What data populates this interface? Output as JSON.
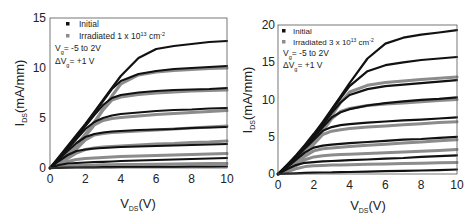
{
  "chart_data": [
    {
      "type": "line",
      "title": "",
      "xlabel": "V_DS(V)",
      "ylabel": "I_DS(mA/mm)",
      "xlim": [
        0,
        10
      ],
      "ylim": [
        0,
        15
      ],
      "xticks": [
        0,
        2,
        4,
        6,
        8,
        10
      ],
      "yticks": [
        0,
        5,
        10,
        15
      ],
      "grid": false,
      "legend_position": "upper-left",
      "legend": [
        {
          "label": "Initial",
          "marker": "square",
          "color": "#111111"
        },
        {
          "label": "Irradiated 1 x 10^13 cm^-2",
          "marker": "square",
          "color": "#8c8c8c"
        }
      ],
      "annotations": [
        "V_g = -5 to 2V",
        "ΔV_g = +1 V"
      ],
      "x": [
        0,
        0.5,
        1,
        1.5,
        2,
        2.5,
        3,
        3.5,
        4,
        5,
        6,
        7,
        8,
        9,
        10
      ],
      "series": [
        {
          "name": "Initial Vg=2V",
          "group": "Initial",
          "values": [
            0,
            1.1,
            2.2,
            3.3,
            4.4,
            5.6,
            6.8,
            8.0,
            9.2,
            11.0,
            11.9,
            12.2,
            12.4,
            12.6,
            12.7
          ]
        },
        {
          "name": "Initial Vg=1V",
          "group": "Initial",
          "values": [
            0,
            1.0,
            2.1,
            3.2,
            4.3,
            5.5,
            6.7,
            7.9,
            8.7,
            9.4,
            9.7,
            9.9,
            10.0,
            10.1,
            10.2
          ]
        },
        {
          "name": "Initial Vg=0V",
          "group": "Initial",
          "values": [
            0,
            0.95,
            2.0,
            3.1,
            4.2,
            5.3,
            6.3,
            7.0,
            7.3,
            7.55,
            7.7,
            7.8,
            7.85,
            7.9,
            8.0
          ]
        },
        {
          "name": "Initial Vg=-1V",
          "group": "Initial",
          "values": [
            0,
            0.9,
            1.9,
            2.9,
            3.9,
            4.6,
            5.0,
            5.25,
            5.4,
            5.55,
            5.7,
            5.8,
            5.85,
            5.95,
            6.0
          ]
        },
        {
          "name": "Initial Vg=-2V",
          "group": "Initial",
          "values": [
            0,
            0.85,
            1.7,
            2.5,
            3.1,
            3.4,
            3.55,
            3.65,
            3.7,
            3.8,
            3.85,
            3.9,
            4.0,
            4.05,
            4.1
          ]
        },
        {
          "name": "Initial Vg=-3V",
          "group": "Initial",
          "values": [
            0,
            0.7,
            1.3,
            1.7,
            1.85,
            1.95,
            2.0,
            2.05,
            2.1,
            2.15,
            2.2,
            2.25,
            2.3,
            2.35,
            2.4
          ]
        },
        {
          "name": "Initial Vg=-4V",
          "group": "Initial",
          "values": [
            0,
            0.3,
            0.45,
            0.5,
            0.55,
            0.6,
            0.62,
            0.65,
            0.7,
            0.75,
            0.8,
            0.85,
            0.9,
            0.95,
            1.0
          ]
        },
        {
          "name": "Initial Vg=-5V",
          "group": "Initial",
          "values": [
            0,
            0.02,
            0.04,
            0.05,
            0.06,
            0.07,
            0.08,
            0.09,
            0.1,
            0.1,
            0.11,
            0.12,
            0.13,
            0.14,
            0.15
          ]
        },
        {
          "name": "Irradiated Vg=1V",
          "group": "Irradiated",
          "values": [
            0,
            0.5,
            1.3,
            2.3,
            3.4,
            4.6,
            5.9,
            7.2,
            8.4,
            9.3,
            9.6,
            9.75,
            9.85,
            9.95,
            10.0
          ]
        },
        {
          "name": "Irradiated Vg=0V",
          "group": "Irradiated",
          "values": [
            0,
            0.5,
            1.25,
            2.2,
            3.3,
            4.5,
            5.8,
            6.8,
            7.1,
            7.35,
            7.5,
            7.6,
            7.7,
            7.75,
            7.8
          ]
        },
        {
          "name": "Irradiated Vg=-1V",
          "group": "Irradiated",
          "values": [
            0,
            0.45,
            1.2,
            2.1,
            3.2,
            4.3,
            4.75,
            4.95,
            5.05,
            5.2,
            5.35,
            5.45,
            5.55,
            5.65,
            5.75
          ]
        },
        {
          "name": "Irradiated Vg=-2V",
          "group": "Irradiated",
          "values": [
            0,
            0.45,
            1.1,
            1.9,
            2.8,
            3.3,
            3.45,
            3.55,
            3.6,
            3.7,
            3.8,
            3.9,
            4.0,
            4.1,
            4.2
          ]
        },
        {
          "name": "Irradiated Vg=-3V",
          "group": "Irradiated",
          "values": [
            0,
            0.4,
            0.95,
            1.5,
            1.85,
            2.0,
            2.1,
            2.15,
            2.2,
            2.3,
            2.4,
            2.45,
            2.55,
            2.6,
            2.7
          ]
        },
        {
          "name": "Irradiated Vg=-4V",
          "group": "Irradiated",
          "values": [
            0,
            0.3,
            0.65,
            0.85,
            0.95,
            1.0,
            1.05,
            1.1,
            1.15,
            1.2,
            1.25,
            1.3,
            1.35,
            1.4,
            1.45
          ]
        },
        {
          "name": "Irradiated Vg=-5V",
          "group": "Irradiated",
          "values": [
            0,
            0.1,
            0.2,
            0.25,
            0.28,
            0.3,
            0.32,
            0.33,
            0.34,
            0.36,
            0.38,
            0.4,
            0.42,
            0.44,
            0.45
          ]
        }
      ]
    },
    {
      "type": "line",
      "title": "",
      "xlabel": "V_DS(V)",
      "ylabel": "I_DS(mA/mm)",
      "xlim": [
        0,
        10
      ],
      "ylim": [
        0,
        20
      ],
      "xticks": [
        0,
        2,
        4,
        6,
        8,
        10
      ],
      "yticks": [
        0,
        5,
        10,
        15,
        20
      ],
      "grid": false,
      "legend_position": "upper-left",
      "legend": [
        {
          "label": "Initial",
          "marker": "square",
          "color": "#111111"
        },
        {
          "label": "Irradiated 3 x 10^13 cm^-2",
          "marker": "square",
          "color": "#8c8c8c"
        }
      ],
      "annotations": [
        "V_g = -5 to 2V",
        "ΔV_g = +1 V"
      ],
      "x": [
        0,
        0.5,
        1,
        1.5,
        2,
        2.5,
        3,
        3.5,
        4,
        5,
        6,
        7,
        8,
        9,
        10
      ],
      "series": [
        {
          "name": "Initial Vg=2V",
          "group": "Initial",
          "values": [
            0,
            1.2,
            2.5,
            3.9,
            5.4,
            7.0,
            8.7,
            10.4,
            12.2,
            15.5,
            17.5,
            18.3,
            18.7,
            19.0,
            19.3
          ]
        },
        {
          "name": "Initial Vg=1V",
          "group": "Initial",
          "values": [
            0,
            1.15,
            2.4,
            3.8,
            5.2,
            6.8,
            8.5,
            10.2,
            11.8,
            13.8,
            14.6,
            15.0,
            15.3,
            15.5,
            15.7
          ]
        },
        {
          "name": "Initial Vg=0V",
          "group": "Initial",
          "values": [
            0,
            1.1,
            2.35,
            3.7,
            5.1,
            6.6,
            8.2,
            9.6,
            10.6,
            11.4,
            11.8,
            12.0,
            12.2,
            12.4,
            12.6
          ]
        },
        {
          "name": "Initial Vg=-1V",
          "group": "Initial",
          "values": [
            0,
            1.05,
            2.25,
            3.6,
            4.9,
            6.3,
            7.6,
            8.3,
            8.7,
            9.2,
            9.5,
            9.75,
            9.95,
            10.1,
            10.3
          ]
        },
        {
          "name": "Initial Vg=-2V",
          "group": "Initial",
          "values": [
            0,
            1.0,
            2.15,
            3.4,
            4.6,
            5.8,
            6.3,
            6.55,
            6.7,
            6.9,
            7.05,
            7.2,
            7.3,
            7.45,
            7.6
          ]
        },
        {
          "name": "Initial Vg=-3V",
          "group": "Initial",
          "values": [
            0,
            0.9,
            1.9,
            2.9,
            3.55,
            3.8,
            3.95,
            4.05,
            4.15,
            4.3,
            4.45,
            4.6,
            4.7,
            4.85,
            5.0
          ]
        },
        {
          "name": "Initial Vg=-4V",
          "group": "Initial",
          "values": [
            0,
            0.65,
            1.2,
            1.5,
            1.6,
            1.7,
            1.75,
            1.8,
            1.85,
            1.95,
            2.05,
            2.15,
            2.3,
            2.4,
            2.5
          ]
        },
        {
          "name": "Initial Vg=-5V",
          "group": "Initial",
          "values": [
            0,
            0.05,
            0.1,
            0.15,
            0.18,
            0.2,
            0.22,
            0.25,
            0.27,
            0.32,
            0.37,
            0.42,
            0.47,
            0.52,
            0.6
          ]
        },
        {
          "name": "Irradiated Vg=0V",
          "group": "Irradiated",
          "values": [
            0,
            0.6,
            1.5,
            2.8,
            4.3,
            6.0,
            7.8,
            9.6,
            11.0,
            11.9,
            12.3,
            12.5,
            12.7,
            12.85,
            13.0
          ]
        },
        {
          "name": "Irradiated Vg=-1V",
          "group": "Irradiated",
          "values": [
            0,
            0.55,
            1.45,
            2.7,
            4.2,
            5.8,
            7.4,
            8.4,
            8.8,
            9.2,
            9.4,
            9.55,
            9.7,
            9.85,
            10.0
          ]
        },
        {
          "name": "Irradiated Vg=-2V",
          "group": "Irradiated",
          "values": [
            0,
            0.5,
            1.4,
            2.6,
            4.0,
            5.3,
            5.75,
            5.95,
            6.1,
            6.3,
            6.45,
            6.6,
            6.75,
            6.9,
            7.0
          ]
        },
        {
          "name": "Irradiated Vg=-3V",
          "group": "Irradiated",
          "values": [
            0,
            0.45,
            1.3,
            2.4,
            3.1,
            3.4,
            3.5,
            3.6,
            3.7,
            3.85,
            4.0,
            4.15,
            4.3,
            4.45,
            4.6
          ]
        },
        {
          "name": "Irradiated Vg=-4V",
          "group": "Irradiated",
          "values": [
            0,
            0.4,
            1.1,
            1.9,
            2.3,
            2.45,
            2.55,
            2.6,
            2.65,
            2.75,
            2.85,
            2.95,
            3.05,
            3.15,
            3.3
          ]
        },
        {
          "name": "Irradiated Vg=-5V",
          "group": "Irradiated",
          "values": [
            0,
            0.3,
            0.7,
            1.0,
            1.1,
            1.15,
            1.2,
            1.22,
            1.25,
            1.3,
            1.35,
            1.4,
            1.45,
            1.5,
            1.55
          ]
        }
      ]
    }
  ],
  "panels": [
    {
      "y_tick_labels": [
        "0",
        "5",
        "10",
        "15"
      ],
      "x_tick_labels": [
        "0",
        "2",
        "4",
        "6",
        "8",
        "10"
      ],
      "ylabel_main": "I",
      "ylabel_sub": "DS",
      "ylabel_rest": "(mA/mm)",
      "xlabel_main": "V",
      "xlabel_sub": "DS",
      "xlabel_rest": "(V)",
      "legend_initial": "Initial",
      "legend_irr_pre": "Irradiated 1 x 10",
      "legend_irr_exp": "13",
      "legend_irr_unit": " cm",
      "legend_irr_unit_exp": "-2",
      "ann1_main": "V",
      "ann1_sub": "g",
      "ann1_rest": "= -5 to 2V",
      "ann2_main": "ΔV",
      "ann2_sub": "g",
      "ann2_rest": "=  +1 V"
    },
    {
      "y_tick_labels": [
        "0",
        "5",
        "10",
        "15",
        "20"
      ],
      "x_tick_labels": [
        "0",
        "2",
        "4",
        "6",
        "8",
        "10"
      ],
      "ylabel_main": "I",
      "ylabel_sub": "DS",
      "ylabel_rest": "(mA/mm)",
      "xlabel_main": "V",
      "xlabel_sub": "DS",
      "xlabel_rest": "(V)",
      "legend_initial": "Initial",
      "legend_irr_pre": "Irradiated 3 x 10",
      "legend_irr_exp": "13",
      "legend_irr_unit": " cm",
      "legend_irr_unit_exp": "-2",
      "ann1_main": "V",
      "ann1_sub": "g",
      "ann1_rest": "= -5 to 2V",
      "ann2_main": "ΔV",
      "ann2_sub": "g",
      "ann2_rest": "=  +1 V"
    }
  ],
  "colors": {
    "initial": "#111111",
    "irradiated": "#8c8c8c",
    "axis": "#444444",
    "text": "#222222"
  }
}
